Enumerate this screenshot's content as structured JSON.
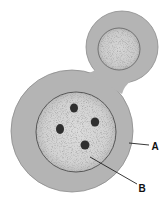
{
  "diagram": {
    "colors": {
      "background": "#ffffff",
      "cytoplasm": "#b4b4b4",
      "cell_outline": "#8c8c8c",
      "nucleus_fill": "#d6d6d6",
      "nucleus_outline": "#555555",
      "chromatin": "#2f2f2f",
      "leader_line": "#222222"
    },
    "labels": [
      {
        "id": "A",
        "text": "A",
        "x": 155,
        "y": 150,
        "line": [
          129,
          143,
          149,
          145
        ]
      },
      {
        "id": "B",
        "text": "B",
        "x": 142,
        "y": 192,
        "line": [
          90,
          157,
          137,
          184
        ]
      }
    ],
    "shapes": {
      "main_cell": {
        "cx": 72,
        "cy": 131,
        "r": 61
      },
      "bud": {
        "cx": 122,
        "cy": 47,
        "r": 36
      },
      "bud_nucleus": {
        "cx": 119,
        "cy": 49,
        "r": 21
      },
      "nucleus": {
        "cx": 76,
        "cy": 132,
        "r": 40
      },
      "chromatin_blobs": [
        {
          "cx": 74,
          "cy": 108
        },
        {
          "cx": 95,
          "cy": 122
        },
        {
          "cx": 60,
          "cy": 129
        },
        {
          "cx": 85,
          "cy": 145
        }
      ]
    }
  }
}
